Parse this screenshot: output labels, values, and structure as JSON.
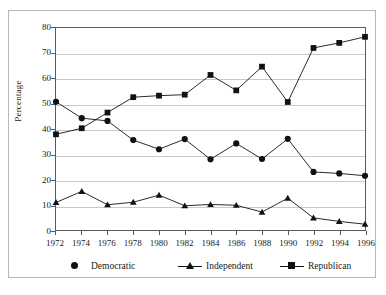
{
  "chart_data": {
    "type": "line",
    "title": "",
    "xlabel": "",
    "ylabel": "Percentage",
    "xlim": [
      1972,
      1996
    ],
    "ylim": [
      0,
      80
    ],
    "grid": true,
    "legend_position": "bottom",
    "x": [
      1972,
      1974,
      1976,
      1978,
      1980,
      1982,
      1984,
      1986,
      1988,
      1990,
      1992,
      1994,
      1996
    ],
    "categories": [
      "1972",
      "1974",
      "1976",
      "1978",
      "1980",
      "1982",
      "1984",
      "1986",
      "1988",
      "1990",
      "1992",
      "1994",
      "1996"
    ],
    "ytick_labels": [
      "0",
      "10",
      "20",
      "30",
      "40",
      "50",
      "60",
      "70",
      "80"
    ],
    "ytick_values": [
      0,
      10,
      20,
      30,
      40,
      50,
      60,
      70,
      80
    ],
    "series": [
      {
        "name": "Democratic",
        "marker": "circle",
        "color": "#111111",
        "values": [
          50.8,
          44.3,
          43.2,
          35.6,
          32.0,
          36.0,
          28.0,
          34.3,
          28.1,
          36.1,
          23.0,
          22.4,
          21.5
        ]
      },
      {
        "name": "Independent",
        "marker": "triangle",
        "color": "#111111",
        "values": [
          10.9,
          15.3,
          10.0,
          11.0,
          13.8,
          9.6,
          10.1,
          9.8,
          7.1,
          12.6,
          4.8,
          3.4,
          2.3
        ]
      },
      {
        "name": "Republican",
        "marker": "square",
        "color": "#111111",
        "values": [
          37.9,
          40.3,
          46.5,
          52.6,
          53.2,
          53.6,
          61.4,
          55.3,
          64.7,
          50.7,
          72.1,
          74.1,
          76.5
        ]
      }
    ]
  },
  "legend": {
    "entries": [
      {
        "label": "Democratic",
        "marker": "circle",
        "show_line": false
      },
      {
        "label": "Independent",
        "marker": "triangle",
        "show_line": true
      },
      {
        "label": "Republican",
        "marker": "square",
        "show_line": true
      }
    ]
  },
  "colors": {
    "series": "#111111",
    "gridline": "#c9c9c9",
    "axis": "#5a5a5a",
    "outer_frame": "#b9b9b9",
    "background": "#ffffff",
    "text": "#1a1a1a"
  }
}
